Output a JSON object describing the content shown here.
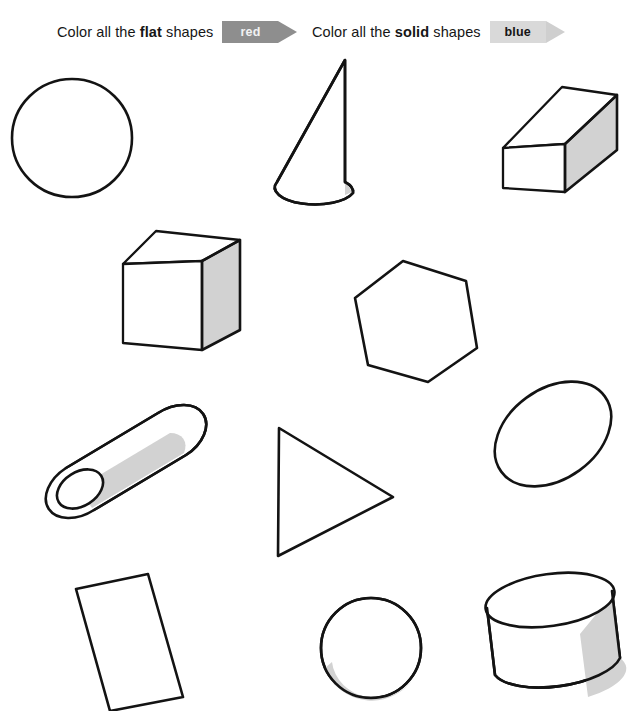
{
  "worksheet": {
    "title": "Color all the flat shapes red / Color all the solid shapes blue",
    "instructions": [
      {
        "id": "flat",
        "text_before": "Color all the ",
        "keyword": "flat",
        "text_after": " shapes",
        "crayon_label": "red",
        "crayon_fill": "#8e8e8e",
        "crayon_text_color": "#f2f2f2"
      },
      {
        "id": "solid",
        "text_before": "Color all the ",
        "keyword": "solid",
        "text_after": " shapes",
        "crayon_label": "blue",
        "crayon_fill": "#d9d9d9",
        "crayon_text_color": "#151515"
      }
    ],
    "colors": {
      "outline": "#131313",
      "shading": "#d2d2d2",
      "paper": "#ffffff"
    },
    "shapes": [
      {
        "name": "circle",
        "kind": "flat",
        "row": 1,
        "column": 1
      },
      {
        "name": "cone",
        "kind": "solid",
        "row": 1,
        "column": 2
      },
      {
        "name": "rectangular-prism",
        "kind": "solid",
        "row": 1,
        "column": 3
      },
      {
        "name": "cube",
        "kind": "solid",
        "row": 2,
        "column": 1
      },
      {
        "name": "hexagon",
        "kind": "flat",
        "row": 2,
        "column": 2
      },
      {
        "name": "oval",
        "kind": "flat",
        "row": 2,
        "column": 3
      },
      {
        "name": "cylinder-tilted",
        "kind": "solid",
        "row": 3,
        "column": 1
      },
      {
        "name": "triangle",
        "kind": "flat",
        "row": 3,
        "column": 2
      },
      {
        "name": "rectangle",
        "kind": "flat",
        "row": 4,
        "column": 1
      },
      {
        "name": "sphere",
        "kind": "solid",
        "row": 4,
        "column": 2
      },
      {
        "name": "cylinder-drum",
        "kind": "solid",
        "row": 4,
        "column": 3
      }
    ]
  }
}
